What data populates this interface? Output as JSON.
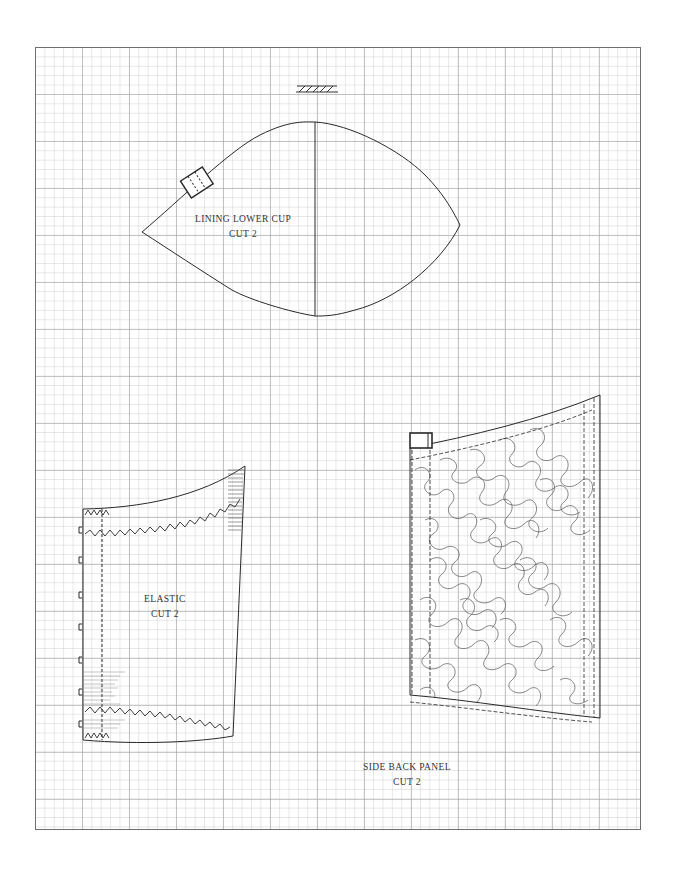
{
  "sheet": {
    "grid": "graph paper",
    "border_color": "#6e6e6e",
    "ink_color": "#2a2a2a"
  },
  "symbols": {
    "grainline": "hatched-grainline-icon"
  },
  "pieces": [
    {
      "id": "lining-lower-cup",
      "name": "LINING LOWER CUP",
      "cut": "CUT 2"
    },
    {
      "id": "elastic",
      "name": "ELASTIC",
      "cut": "CUT 2"
    },
    {
      "id": "side-back-panel",
      "name": "SIDE BACK PANEL",
      "cut": "CUT 2"
    }
  ]
}
